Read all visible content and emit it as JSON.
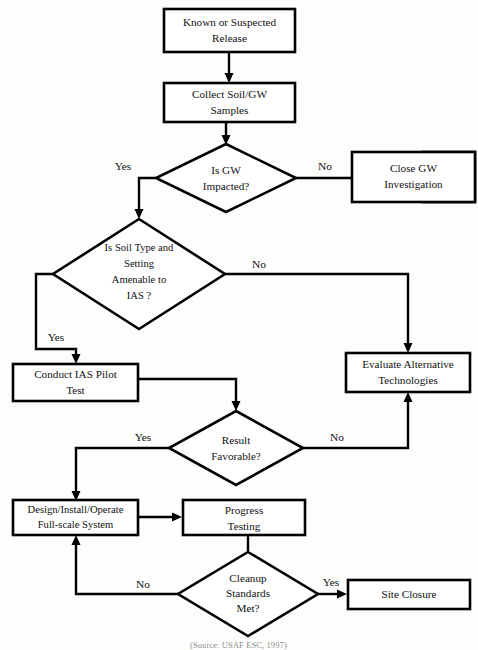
{
  "diagram": {
    "caption": "(Source: USAF ESC, 1997)",
    "colors": {
      "stroke": "#000000",
      "fill": "#ffffff",
      "background": "#fdfdfc",
      "text": "#111111"
    },
    "nodes": [
      {
        "id": "known-release",
        "shape": "box",
        "line1": "Known or Suspected",
        "line2": "Release"
      },
      {
        "id": "collect-samples",
        "shape": "box",
        "line1": "Collect Soil/GW",
        "line2": "Samples"
      },
      {
        "id": "gw-impacted",
        "shape": "diamond",
        "line1": "Is GW",
        "line2": "Impacted?"
      },
      {
        "id": "close-gw-investigation",
        "shape": "box",
        "line1": "Close GW",
        "line2": "Investigation"
      },
      {
        "id": "soil-type-amenable",
        "shape": "diamond",
        "line1": "Is Soil Type and",
        "line2": "Setting",
        "line3": "Amenable to",
        "line4": "IAS ?"
      },
      {
        "id": "conduct-pilot-test",
        "shape": "box",
        "line1": "Conduct IAS Pilot",
        "line2": "Test"
      },
      {
        "id": "evaluate-alternatives",
        "shape": "box",
        "line1": "Evaluate Alternative",
        "line2": "Technologies"
      },
      {
        "id": "result-favorable",
        "shape": "diamond",
        "line1": "Result",
        "line2": "Favorable?"
      },
      {
        "id": "design-install-operate",
        "shape": "box",
        "line1": "Design/Install/Operate",
        "line2": "Full-scale System"
      },
      {
        "id": "progress-testing",
        "shape": "box",
        "line1": "Progress",
        "line2": "Testing"
      },
      {
        "id": "cleanup-standards",
        "shape": "diamond",
        "line1": "Cleanup",
        "line2": "Standards",
        "line3": "Met?"
      },
      {
        "id": "site-closure",
        "shape": "box",
        "line1": "Site Closure"
      }
    ],
    "edge_labels": {
      "gw_yes": "Yes",
      "gw_no": "No",
      "soil_yes": "Yes",
      "soil_no": "No",
      "result_yes": "Yes",
      "result_no": "No",
      "cleanup_no": "No",
      "cleanup_yes": "Yes"
    }
  }
}
